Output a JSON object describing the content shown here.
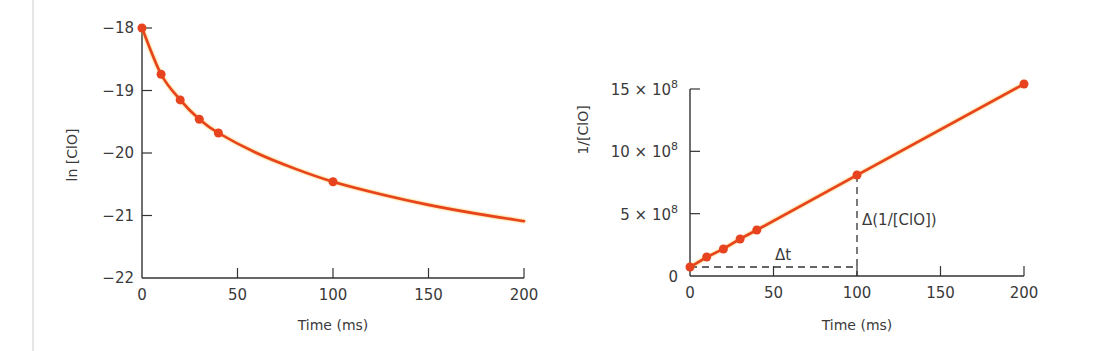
{
  "colors": {
    "series": "#e8431f",
    "series_glow": "#f7b52c",
    "axis": "#333333",
    "text": "#3a3a3a",
    "edge_rule": "#e6e6e6"
  },
  "chart_data": [
    {
      "type": "line",
      "title": "",
      "xlabel": "Time (ms)",
      "ylabel": "ln [ClO]",
      "xlim": [
        0,
        200
      ],
      "ylim": [
        -22,
        -18
      ],
      "x_ticks": [
        0,
        50,
        100,
        150,
        200
      ],
      "x_tick_labels": [
        "0",
        "50",
        "100",
        "150",
        "200"
      ],
      "y_ticks": [
        -22,
        -21,
        -20,
        -19,
        -18
      ],
      "y_tick_labels": [
        "−22",
        "−21",
        "−20",
        "−19",
        "−18"
      ],
      "grid": false,
      "legend": null,
      "series": [
        {
          "name": "ln [ClO]",
          "markers": {
            "x": [
              0,
              10,
              20,
              30,
              40,
              100
            ],
            "y": [
              -18.0,
              -18.74,
              -19.15,
              -19.46,
              -19.68,
              -20.46
            ]
          },
          "curve": {
            "x": [
              0,
              10,
              20,
              30,
              40,
              60,
              80,
              100,
              125,
              150,
              175,
              200
            ],
            "y": [
              -18.0,
              -18.74,
              -19.15,
              -19.46,
              -19.68,
              -20.0,
              -20.25,
              -20.46,
              -20.66,
              -20.83,
              -20.97,
              -21.09
            ]
          }
        }
      ]
    },
    {
      "type": "line",
      "title": "",
      "xlabel": "Time (ms)",
      "ylabel": "1/[ClO]",
      "xlim": [
        0,
        200
      ],
      "ylim": [
        0,
        1500000000
      ],
      "x_ticks": [
        0,
        50,
        100,
        150,
        200
      ],
      "x_tick_labels": [
        "0",
        "50",
        "100",
        "150",
        "200"
      ],
      "y_ticks": [
        0,
        500000000,
        1000000000,
        1500000000
      ],
      "y_tick_labels": [
        {
          "base": "0",
          "exp": ""
        },
        {
          "base": "5 × 10",
          "exp": "8"
        },
        {
          "base": "10 × 10",
          "exp": "8"
        },
        {
          "base": "15 × 10",
          "exp": "8"
        }
      ],
      "grid": false,
      "legend": null,
      "series": [
        {
          "name": "1/[ClO]",
          "x": [
            0,
            10,
            20,
            30,
            40,
            100,
            200
          ],
          "y": [
            72000000,
            152000000,
            217000000,
            297000000,
            369000000,
            810000000,
            1540000000
          ]
        }
      ],
      "annotations": [
        {
          "text": "Δt",
          "type": "dashed-horizontal",
          "from_x": 0,
          "to_x": 100,
          "at_y": 72000000
        },
        {
          "text": "Δ(1/[ClO])",
          "type": "dashed-vertical",
          "at_x": 100,
          "from_y": 0,
          "to_y": 810000000
        }
      ]
    }
  ]
}
